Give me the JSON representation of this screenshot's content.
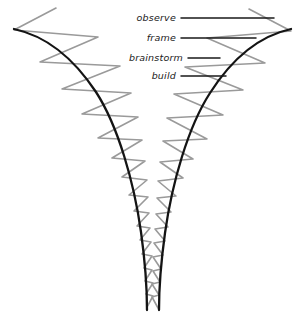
{
  "diagram": {
    "type": "funnel-with-iteration-zigzag",
    "background_color": "#ffffff",
    "funnel_color": "#1a1a1a",
    "zigzag_color": "#9a9a9a",
    "leader_line_color": "#1a1a1a",
    "text_color": "#1a1a1a",
    "labels": [
      {
        "id": "observe",
        "text": "observe",
        "text_anchor_x": 176,
        "text_y": 21,
        "leader_x1": 181,
        "leader_x2": 274,
        "leader_y": 18
      },
      {
        "id": "frame",
        "text": "frame",
        "text_anchor_x": 176,
        "text_y": 41,
        "leader_x1": 181,
        "leader_x2": 256,
        "leader_y": 38
      },
      {
        "id": "brainstorm",
        "text": "brainstorm",
        "text_anchor_x": 183,
        "text_y": 61,
        "leader_x1": 188,
        "leader_x2": 220,
        "leader_y": 58
      },
      {
        "id": "build",
        "text": "build",
        "text_anchor_x": 176,
        "text_y": 79,
        "leader_x1": 181,
        "leader_x2": 226,
        "leader_y": 76
      }
    ],
    "funnel_left_path": "M 14,29 C 46,36 72,56 96,92 C 118,126 134,182 141,232 C 146,268 147,292 147,310",
    "funnel_right_path": "M 291,29 C 259,36 233,57 210,93 C 188,127 172,183 165,233 C 160,269 159,292 159,310",
    "zigzag_left_path": "M 56,8 L 14,30 L 98,37 L 40,62 L 120,66 L 62,89 L 131,93 L 82,114 L 138,117 L 98,138 L 142,140 L 112,158 L 145,161 L 122,177 L 147,180 L 129,195 L 148,197 L 134,211 L 149,213 L 137,226 L 150,228 L 140,240 L 151,242 L 142,254 L 152,256 L 144,268 L 152,270 L 145,281 L 153,283 L 146,294 L 153,296 L 147,307",
    "zigzag_right_path": "M 249,9 L 291,31 L 207,38 L 265,63 L 185,67 L 243,90 L 174,94 L 223,115 L 167,118 L 207,139 L 163,141 L 193,159 L 160,162 L 183,178 L 158,181 L 176,196 L 157,198 L 171,212 L 156,214 L 168,227 L 155,229 L 165,241 L 154,243 L 163,255 L 153,257 L 161,269 L 153,271 L 160,282 L 152,284 L 159,295 L 152,297 L 158,308"
  }
}
